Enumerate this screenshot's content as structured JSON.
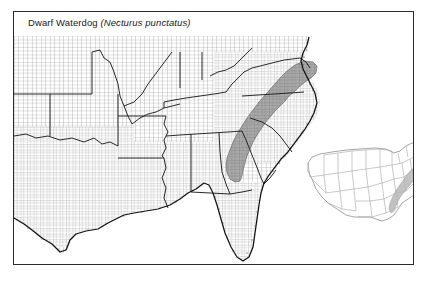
{
  "figure": {
    "caption_common_name": "Dwarf Waterdog ",
    "caption_scientific_name": "(Necturus punctatus)",
    "frame_color": "#2b2b2b",
    "background_color": "#ffffff"
  },
  "map": {
    "type": "species-range-distribution-map",
    "region": "Southeastern United States",
    "basemap_detail": "county boundaries",
    "county_line_color": "#8c8c8c",
    "state_line_color": "#1f1f1f",
    "coastline_color": "#111111",
    "range_fill_color": "#a8a8a8",
    "range_description": "Atlantic Coastal Plain from southeastern Virginia through North Carolina and South Carolina into southeastern Georgia",
    "states_shown": [
      "Texas",
      "Oklahoma",
      "Kansas",
      "Missouri",
      "Arkansas",
      "Louisiana",
      "Mississippi",
      "Alabama",
      "Tennessee",
      "Kentucky",
      "Illinois",
      "Indiana",
      "Ohio",
      "West Virginia",
      "Virginia",
      "North Carolina",
      "South Carolina",
      "Georgia",
      "Florida",
      "Maryland",
      "Delaware"
    ],
    "range_states": [
      "Virginia",
      "North Carolina",
      "South Carolina",
      "Georgia"
    ]
  },
  "inset": {
    "title": "United States locator inset",
    "outline_color": "#9a9a9a",
    "range_fill_color": "#b8b8b8",
    "range_description": "Southeast Atlantic coast highlighted"
  }
}
